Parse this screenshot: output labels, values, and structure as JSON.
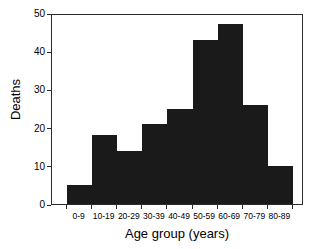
{
  "chart_data": {
    "type": "bar",
    "title": "",
    "subtitle": "",
    "xlabel": "Age group (years)",
    "ylabel": "Deaths",
    "categories": [
      "0-9",
      "10-19",
      "20-29",
      "30-39",
      "40-49",
      "50-59",
      "60-69",
      "70-79",
      "80-89"
    ],
    "values": [
      5,
      18,
      14,
      21,
      25,
      43,
      47,
      26,
      10
    ],
    "ylim": [
      0,
      50
    ],
    "yticks": [
      0,
      10,
      20,
      30,
      40,
      50
    ],
    "ytick_labels": [
      "0",
      "10",
      "20",
      "30",
      "40",
      "50"
    ],
    "grid": false,
    "legend": null,
    "bar_color": "#1a1a1a",
    "axis_color": "#2b2b2b",
    "background_color": "#ffffff",
    "annotations": []
  }
}
